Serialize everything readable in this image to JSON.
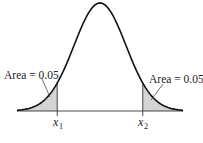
{
  "chart_data": {
    "type": "area",
    "title": "",
    "xlabel": "",
    "ylabel": "",
    "grid": false,
    "legend": null,
    "distribution": {
      "name": "normal",
      "mean": 0,
      "sd": 1
    },
    "x_markers": [
      {
        "label": "x",
        "subscript": "1",
        "z": -1.645
      },
      {
        "label": "x",
        "subscript": "2",
        "z": 1.645
      }
    ],
    "shaded_regions": [
      {
        "side": "left",
        "from": "-inf",
        "to": "x1",
        "area": 0.05,
        "color": "#d4d4d4"
      },
      {
        "side": "right",
        "from": "x2",
        "to": "+inf",
        "area": 0.05,
        "color": "#d4d4d4"
      }
    ],
    "annotations": [
      {
        "text": "Area = 0.05",
        "points_to": "left tail"
      },
      {
        "text": "Area = 0.05",
        "points_to": "right tail"
      }
    ]
  },
  "labels": {
    "left_area": "Area = 0.05",
    "right_area": "Area = 0.05",
    "x1_main": "x",
    "x1_sub": "1",
    "x2_main": "x",
    "x2_sub": "2"
  },
  "colors": {
    "curve": "#111111",
    "shade": "#d4d4d4",
    "axis": "#333333"
  }
}
